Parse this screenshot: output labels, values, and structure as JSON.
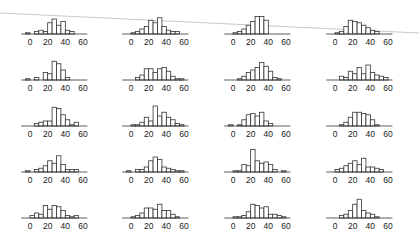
{
  "chart_data": {
    "type": "bar",
    "layout": {
      "rows": 5,
      "cols": 4,
      "panel_type": "histogram"
    },
    "title": "",
    "xlabel": "",
    "ylabel": "",
    "xlim": [
      -10,
      65
    ],
    "x_ticks": [
      0,
      20,
      40,
      60
    ],
    "x_tick_labels": [
      "0",
      "20",
      "40",
      "60"
    ],
    "bin_edges": [
      -5,
      0,
      5,
      10,
      15,
      20,
      25,
      30,
      35,
      40,
      45,
      50,
      55,
      60
    ],
    "grid": false,
    "legend": null,
    "colors": {
      "bar_fill": "#ffffff",
      "bar_stroke": "#333333",
      "axis": "#333333",
      "artifact_line": "#c8c8c8"
    },
    "panels": [
      {
        "row": 1,
        "col": 1,
        "counts": [
          1,
          0,
          2,
          3,
          2,
          9,
          12,
          7,
          10,
          3,
          2,
          0,
          0
        ]
      },
      {
        "row": 1,
        "col": 2,
        "counts": [
          0,
          1,
          2,
          4,
          6,
          11,
          9,
          13,
          6,
          3,
          2,
          2,
          0
        ]
      },
      {
        "row": 1,
        "col": 3,
        "counts": [
          0,
          1,
          2,
          4,
          7,
          10,
          14,
          14,
          11,
          0,
          0,
          0,
          0
        ]
      },
      {
        "row": 1,
        "col": 4,
        "counts": [
          0,
          1,
          2,
          6,
          11,
          10,
          9,
          7,
          5,
          3,
          2,
          0,
          0
        ]
      },
      {
        "row": 2,
        "col": 1,
        "counts": [
          1,
          0,
          2,
          0,
          6,
          5,
          15,
          13,
          8,
          2,
          0,
          0,
          0
        ]
      },
      {
        "row": 2,
        "col": 2,
        "counts": [
          0,
          0,
          2,
          4,
          9,
          9,
          6,
          9,
          10,
          7,
          3,
          1,
          1
        ]
      },
      {
        "row": 2,
        "col": 3,
        "counts": [
          0,
          0,
          1,
          3,
          6,
          8,
          10,
          14,
          11,
          7,
          2,
          1,
          0
        ]
      },
      {
        "row": 2,
        "col": 4,
        "counts": [
          0,
          0,
          3,
          2,
          7,
          5,
          10,
          5,
          12,
          6,
          4,
          3,
          2
        ]
      },
      {
        "row": 3,
        "col": 1,
        "counts": [
          0,
          0,
          2,
          3,
          4,
          4,
          15,
          14,
          9,
          5,
          1,
          3,
          0
        ]
      },
      {
        "row": 3,
        "col": 2,
        "counts": [
          0,
          1,
          1,
          3,
          7,
          4,
          16,
          8,
          11,
          7,
          5,
          2,
          1
        ]
      },
      {
        "row": 3,
        "col": 3,
        "counts": [
          1,
          0,
          1,
          5,
          9,
          10,
          8,
          11,
          4,
          2,
          0,
          0,
          0
        ]
      },
      {
        "row": 3,
        "col": 4,
        "counts": [
          0,
          0,
          1,
          3,
          7,
          11,
          11,
          10,
          9,
          5,
          1,
          0,
          0
        ]
      },
      {
        "row": 4,
        "col": 1,
        "counts": [
          1,
          0,
          2,
          3,
          5,
          9,
          7,
          13,
          6,
          2,
          2,
          2,
          0
        ]
      },
      {
        "row": 4,
        "col": 2,
        "counts": [
          1,
          0,
          2,
          2,
          4,
          9,
          12,
          10,
          4,
          3,
          2,
          1,
          1
        ]
      },
      {
        "row": 4,
        "col": 3,
        "counts": [
          0,
          1,
          1,
          6,
          5,
          18,
          9,
          7,
          8,
          6,
          2,
          0,
          1
        ]
      },
      {
        "row": 4,
        "col": 4,
        "counts": [
          0,
          2,
          3,
          5,
          7,
          9,
          6,
          11,
          4,
          4,
          3,
          2,
          0
        ]
      },
      {
        "row": 5,
        "col": 1,
        "counts": [
          0,
          2,
          4,
          3,
          10,
          7,
          10,
          9,
          6,
          2,
          1,
          2,
          0
        ]
      },
      {
        "row": 5,
        "col": 2,
        "counts": [
          0,
          1,
          2,
          4,
          8,
          8,
          7,
          11,
          6,
          6,
          3,
          1,
          0
        ]
      },
      {
        "row": 5,
        "col": 3,
        "counts": [
          0,
          1,
          1,
          2,
          5,
          11,
          10,
          8,
          9,
          3,
          3,
          2,
          1
        ]
      },
      {
        "row": 5,
        "col": 4,
        "counts": [
          0,
          0,
          2,
          3,
          6,
          11,
          15,
          6,
          4,
          3,
          1,
          0,
          0
        ]
      }
    ]
  }
}
